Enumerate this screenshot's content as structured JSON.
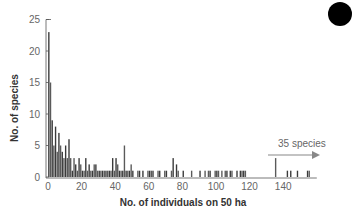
{
  "chart_data": {
    "type": "bar",
    "title": "",
    "xlabel": "No. of individuals on 50 ha",
    "ylabel": "No. of species",
    "xlim": [
      0,
      160
    ],
    "ylim": [
      0,
      25
    ],
    "xticks": [
      0,
      20,
      40,
      60,
      80,
      100,
      120,
      140
    ],
    "yticks": [
      0,
      5,
      10,
      15,
      20,
      25
    ],
    "grid": false,
    "annotation": {
      "text": "35 species",
      "arrow": "right",
      "meaning": "additional species beyond axis"
    },
    "x": [
      1,
      2,
      3,
      4,
      5,
      6,
      7,
      8,
      9,
      10,
      11,
      12,
      13,
      14,
      15,
      16,
      17,
      18,
      19,
      20,
      21,
      22,
      23,
      24,
      25,
      26,
      27,
      28,
      29,
      30,
      31,
      32,
      33,
      34,
      35,
      36,
      37,
      38,
      39,
      40,
      41,
      42,
      43,
      44,
      45,
      46,
      47,
      48,
      49,
      50,
      51,
      52,
      53,
      54,
      55,
      56,
      57,
      58,
      59,
      60,
      61,
      62,
      63,
      64,
      65,
      66,
      67,
      68,
      69,
      70,
      71,
      72,
      73,
      74,
      75,
      76,
      77,
      78,
      79,
      80,
      81,
      82,
      83,
      84,
      85,
      86,
      87,
      88,
      89,
      90,
      91,
      92,
      93,
      94,
      95,
      96,
      97,
      98,
      99,
      100,
      101,
      102,
      103,
      104,
      105,
      106,
      107,
      108,
      109,
      110,
      111,
      112,
      113,
      114,
      115,
      116,
      117,
      118,
      119,
      120,
      121,
      122,
      123,
      124,
      125,
      126,
      127,
      128,
      129,
      130,
      131,
      132,
      133,
      134,
      135,
      136,
      137,
      138,
      139,
      140,
      141,
      142,
      143,
      144,
      145,
      146,
      147,
      148,
      149,
      150,
      151,
      152,
      153,
      154,
      155,
      156,
      157,
      158,
      159,
      160
    ],
    "values": [
      23,
      15,
      9,
      5,
      8,
      4,
      7,
      5,
      4,
      3,
      5,
      3,
      6,
      3,
      1,
      3,
      2,
      1,
      3,
      2,
      1,
      1,
      3,
      1,
      2,
      1,
      1,
      2,
      2,
      1,
      1,
      1,
      1,
      1,
      1,
      1,
      1,
      1,
      3,
      1,
      3,
      2,
      1,
      1,
      1,
      5,
      1,
      1,
      1,
      2,
      1,
      0,
      0,
      1,
      1,
      0,
      1,
      0,
      0,
      1,
      1,
      1,
      1,
      0,
      0,
      1,
      1,
      0,
      0,
      1,
      1,
      0,
      0,
      1,
      3,
      0,
      2,
      1,
      0,
      0,
      1,
      0,
      0,
      0,
      0,
      1,
      0,
      0,
      0,
      0,
      1,
      0,
      0,
      1,
      0,
      1,
      1,
      0,
      0,
      1,
      1,
      1,
      0,
      1,
      0,
      1,
      1,
      0,
      1,
      1,
      0,
      0,
      1,
      0,
      1,
      1,
      1,
      1,
      0,
      0,
      0,
      0,
      0,
      0,
      0,
      0,
      0,
      0,
      0,
      0,
      0,
      0,
      0,
      0,
      0,
      3,
      0,
      0,
      0,
      0,
      0,
      0,
      1,
      0,
      1,
      0,
      0,
      0,
      1,
      0,
      0,
      0,
      0,
      0,
      1,
      1,
      0,
      0,
      0,
      0
    ]
  },
  "labels": {
    "ylabel": "No. of species",
    "xlabel": "No. of individuals on 50 ha",
    "annotation": "35 species"
  },
  "colors": {
    "bar": "#3a3a3a",
    "bar_alt": "#5a5a5a",
    "axis": "#555555",
    "tick_text": "#666666",
    "annotation_arrow": "#888888"
  }
}
